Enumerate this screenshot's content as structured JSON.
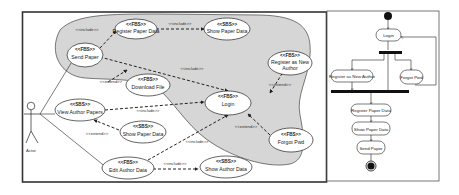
{
  "use_case_diagram": {
    "actor": {
      "label": "Actor"
    },
    "use_cases": [
      {
        "id": "register_paper_data",
        "stereotype": "<<FBS>>",
        "label": "Register Paper Data"
      },
      {
        "id": "show_paper_data_top",
        "stereotype": "<<SBS>>",
        "label": "Show Paper Data"
      },
      {
        "id": "send_paper",
        "stereotype": "<<FBS>>",
        "label": "Send Paper"
      },
      {
        "id": "register_new_author",
        "stereotype": "<<FBS>>",
        "label_line1": "Register as New",
        "label_line2": "Author"
      },
      {
        "id": "download_file",
        "stereotype": "<<FBS>>",
        "label": "Download File"
      },
      {
        "id": "view_author_papers",
        "stereotype": "<<SBS>>",
        "label": "View Author Papers"
      },
      {
        "id": "login",
        "stereotype": "<<FBS>>",
        "label": "Login"
      },
      {
        "id": "show_paper_data_mid",
        "stereotype": "<<SBS>>",
        "label": "Show Paper Data"
      },
      {
        "id": "forgot_pwd",
        "stereotype": "<<FBS>>",
        "label": "Forgot Pwd"
      },
      {
        "id": "edit_author_data",
        "stereotype": "<<FBS>>",
        "label": "Edit Author Data"
      },
      {
        "id": "show_author_data",
        "stereotype": "<<SBS>>",
        "label": "Show Author Data"
      }
    ],
    "relations": {
      "include": "<<include>>",
      "extend": "<<extend>>"
    },
    "colors": {
      "highlight_region": "#d6d6d6",
      "line": "#222222",
      "frame": "#333333"
    }
  },
  "activity_diagram": {
    "nodes": [
      {
        "id": "login",
        "label": "Login"
      },
      {
        "id": "register_new_author",
        "label": "Register as New Author"
      },
      {
        "id": "forgot_pwd",
        "label": "Forgot Pwd"
      },
      {
        "id": "register_paper_data",
        "label": "Register Paper Data"
      },
      {
        "id": "show_paper_data",
        "label": "Show Paper Data"
      },
      {
        "id": "send_paper",
        "label": "Send Paper"
      }
    ]
  }
}
